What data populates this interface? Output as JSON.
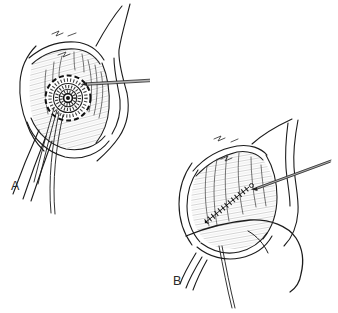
{
  "figure": {
    "background_color": "#ffffff",
    "line_color": "#1c1c1c",
    "probe_shaft_color": "#b5b5b5",
    "panels": [
      {
        "label": "A"
      },
      {
        "label": "B"
      }
    ]
  }
}
